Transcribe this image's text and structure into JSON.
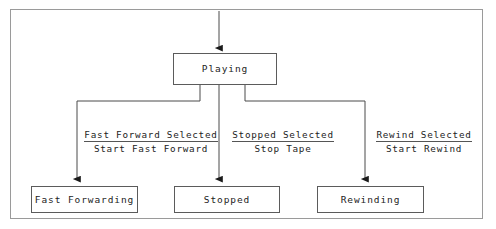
{
  "figure": {
    "kind": "state-transition-diagram",
    "background_color": "#ffffff",
    "frame_color": "#9a9a9a",
    "line_color": "#4a4a4a",
    "text_color": "#1d1d1d"
  },
  "states": [
    {
      "id": "playing",
      "label": "Playing",
      "x": 173,
      "y": 53,
      "width": 104,
      "height": 32
    },
    {
      "id": "fast-forwarding",
      "label": "Fast Forwarding",
      "x": 31,
      "y": 186,
      "width": 107,
      "height": 27
    },
    {
      "id": "stopped",
      "label": "Stopped",
      "x": 174,
      "y": 186,
      "width": 106,
      "height": 27
    },
    {
      "id": "rewinding",
      "label": "Rewinding",
      "x": 317,
      "y": 186,
      "width": 107,
      "height": 27
    }
  ],
  "transitions": [
    {
      "id": "fast-forward-selected",
      "from": "playing",
      "to": "fast-forwarding",
      "guard": "Fast Forward Selected",
      "action": "Start Fast Forward",
      "label_x": 81,
      "label_y": 124,
      "label_width": 140
    },
    {
      "id": "stopped-selected",
      "from": "playing",
      "to": "stopped",
      "guard": "Stopped Selected",
      "action": "Stop Tape",
      "label_x": 228,
      "label_y": 124,
      "label_width": 110
    },
    {
      "id": "rewind-selected",
      "from": "playing",
      "to": "rewinding",
      "guard": "Rewind Selected",
      "action": "Start Rewind",
      "label_x": 372,
      "label_y": 124,
      "label_width": 104
    }
  ],
  "initial_transition": {
    "id": "initial-entry",
    "to": "playing",
    "label": ""
  }
}
